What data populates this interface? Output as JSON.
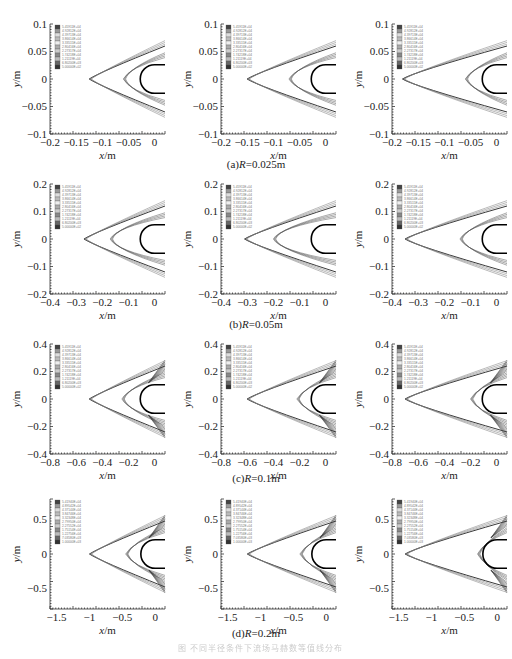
{
  "figure": {
    "caption_bottom": "图 不同半径条件下流场马赫数等值线分布",
    "rows": [
      {
        "label_prefix": "(a)",
        "label_var": "R",
        "label_value": "=0.025m"
      },
      {
        "label_prefix": "(b)",
        "label_var": "R",
        "label_value": "=0.05m"
      },
      {
        "label_prefix": "(c)",
        "label_var": "R",
        "label_value": "=0.1m"
      },
      {
        "label_prefix": "(d)",
        "label_var": "R",
        "label_value": "=0.2m"
      }
    ]
  },
  "chart_data": [
    {
      "type": "contour",
      "row": "a",
      "col": 1,
      "title": "",
      "xlabel": "x/m",
      "ylabel": "y/m",
      "xlim": [
        -0.2,
        0.02
      ],
      "ylim": [
        -0.1,
        0.1
      ],
      "xticks": [
        "-0.2",
        "-0.15",
        "-0.1",
        "-0.05",
        "0"
      ],
      "yticks": [
        "0.1",
        "0.05",
        "0",
        "-0.05",
        "-0.1"
      ],
      "legend": [
        "5.45911E+04",
        "4.92812E+04",
        "4.39713E+04",
        "3.86614E+04",
        "3.33515E+04",
        "2.80416E+04",
        "2.27317E+04",
        "1.74218E+04",
        "1.21119E+04",
        "6.80200E+03",
        "5.00000E+02"
      ],
      "shock_front_x": -0.125,
      "inner_front_x": -0.06
    },
    {
      "type": "contour",
      "row": "a",
      "col": 2,
      "xlabel": "x/m",
      "ylabel": "y/m",
      "xlim": [
        -0.2,
        0.02
      ],
      "ylim": [
        -0.1,
        0.1
      ],
      "xticks": [
        "-0.2",
        "-0.15",
        "-0.1",
        "-0.05",
        "0"
      ],
      "yticks": [
        "0.1",
        "0.05",
        "0",
        "-0.05",
        "-0.1"
      ],
      "shock_front_x": -0.15,
      "inner_front_x": -0.07
    },
    {
      "type": "contour",
      "row": "a",
      "col": 3,
      "xlabel": "x/m",
      "ylabel": "y/m",
      "xlim": [
        -0.2,
        0.02
      ],
      "ylim": [
        -0.1,
        0.1
      ],
      "xticks": [
        "-0.2",
        "-0.15",
        "-0.1",
        "-0.05",
        "0"
      ],
      "yticks": [
        "0.1",
        "0.05",
        "0",
        "-0.05",
        "-0.1"
      ],
      "shock_front_x": -0.18,
      "inner_front_x": -0.06
    },
    {
      "type": "contour",
      "row": "b",
      "col": 1,
      "xlabel": "x/m",
      "ylabel": "y/m",
      "xlim": [
        -0.4,
        0.04
      ],
      "ylim": [
        -0.2,
        0.2
      ],
      "xticks": [
        "-0.4",
        "-0.3",
        "-0.2",
        "-0.1",
        "0"
      ],
      "yticks": [
        "0.2",
        "0.1",
        "0",
        "-0.1",
        "-0.2"
      ],
      "shock_front_x": -0.27,
      "inner_front_x": -0.17
    },
    {
      "type": "contour",
      "row": "b",
      "col": 2,
      "xlabel": "x/m",
      "ylabel": "y/m",
      "xlim": [
        -0.4,
        0.04
      ],
      "ylim": [
        -0.2,
        0.2
      ],
      "xticks": [
        "-0.4",
        "-0.3",
        "-0.2",
        "-0.1",
        "0"
      ],
      "yticks": [
        "0.2",
        "0.1",
        "0",
        "-0.1",
        "-0.2"
      ],
      "shock_front_x": -0.31,
      "inner_front_x": -0.2
    },
    {
      "type": "contour",
      "row": "b",
      "col": 3,
      "xlabel": "x/m",
      "ylabel": "y/m",
      "xlim": [
        -0.4,
        0.04
      ],
      "ylim": [
        -0.2,
        0.2
      ],
      "xticks": [
        "-0.4",
        "-0.3",
        "-0.2",
        "-0.1",
        "0"
      ],
      "yticks": [
        "0.2",
        "0.1",
        "0",
        "-0.1",
        "-0.2"
      ],
      "shock_front_x": -0.35,
      "inner_front_x": -0.14
    },
    {
      "type": "contour",
      "row": "c",
      "col": 1,
      "xlabel": "x/m",
      "ylabel": "y/m",
      "xlim": [
        -0.8,
        0.08
      ],
      "ylim": [
        -0.4,
        0.4
      ],
      "xticks": [
        "-0.8",
        "-0.6",
        "-0.4",
        "-0.2",
        "0"
      ],
      "yticks": [
        "0.4",
        "0.2",
        "0",
        "-0.2",
        "-0.4"
      ],
      "shock_front_x": -0.5,
      "inner_front_x": -0.25
    },
    {
      "type": "contour",
      "row": "c",
      "col": 2,
      "xlabel": "x/m",
      "ylabel": "y/m",
      "xlim": [
        -0.8,
        0.08
      ],
      "ylim": [
        -0.4,
        0.4
      ],
      "xticks": [
        "-0.8",
        "-0.6",
        "-0.4",
        "-0.2",
        "0"
      ],
      "yticks": [
        "0.4",
        "0.2",
        "0",
        "-0.2",
        "-0.4"
      ],
      "shock_front_x": -0.6,
      "inner_front_x": -0.22
    },
    {
      "type": "contour",
      "row": "c",
      "col": 3,
      "xlabel": "x/m",
      "ylabel": "y/m",
      "xlim": [
        -0.8,
        0.08
      ],
      "ylim": [
        -0.4,
        0.4
      ],
      "xticks": [
        "-0.8",
        "-0.6",
        "-0.4",
        "-0.2",
        "0"
      ],
      "yticks": [
        "0.4",
        "0.2",
        "0",
        "-0.2",
        "-0.4"
      ],
      "shock_front_x": -0.7,
      "inner_front_x": -0.2
    },
    {
      "type": "contour",
      "row": "d",
      "col": 1,
      "xlabel": "x/m",
      "ylabel": "y/m",
      "xlim": [
        -1.6,
        0.15
      ],
      "ylim": [
        -0.8,
        0.8
      ],
      "xticks": [
        "-1.5",
        "-1",
        "-0.5",
        "0"
      ],
      "yticks": [
        "0.5",
        "0",
        "-0.5"
      ],
      "legend": [
        "5.41940E+04",
        "4.89542E+04",
        "4.37144E+04",
        "3.84746E+04",
        "3.32348E+04",
        "2.79950E+04",
        "2.27552E+04",
        "1.75154E+04",
        "1.22756E+04",
        "7.03580E+03",
        "1.00000E+03"
      ],
      "shock_front_x": -1.0,
      "inner_front_x": -0.45
    },
    {
      "type": "contour",
      "row": "d",
      "col": 2,
      "xlabel": "x/m",
      "ylabel": "y/m",
      "xlim": [
        -1.6,
        0.15
      ],
      "ylim": [
        -0.8,
        0.8
      ],
      "xticks": [
        "-1.5",
        "-1",
        "-0.5",
        "0"
      ],
      "yticks": [
        "0.5",
        "0",
        "-0.5"
      ],
      "shock_front_x": -1.2,
      "inner_front_x": -0.4
    },
    {
      "type": "contour",
      "row": "d",
      "col": 3,
      "xlabel": "x/m",
      "ylabel": "y/m",
      "xlim": [
        -1.6,
        0.15
      ],
      "ylim": [
        -0.8,
        0.8
      ],
      "xticks": [
        "-1.5",
        "-1",
        "-0.5",
        "0"
      ],
      "yticks": [
        "0.5",
        "0",
        "-0.5"
      ],
      "shock_front_x": -1.4,
      "inner_front_x": -0.3
    }
  ]
}
